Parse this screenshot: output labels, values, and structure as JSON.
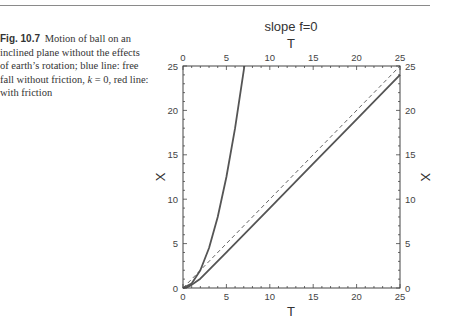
{
  "caption": {
    "fig_label": "Fig. 10.7",
    "text_before_k": "Motion of ball on an inclined plane without the effects of earth’s rotation; blue line: free fall without friction, ",
    "k_symbol": "k",
    "text_after_k": " = 0, red line: with friction"
  },
  "chart_data": {
    "type": "line",
    "title": "slope f=0",
    "xlabel": "T",
    "ylabel": "X",
    "xlabel_top": "T",
    "ylabel_right": "X",
    "xlim": [
      0,
      25
    ],
    "ylim": [
      0,
      25
    ],
    "xticks": [
      0,
      5,
      10,
      15,
      20,
      25
    ],
    "yticks": [
      0,
      5,
      10,
      15,
      20,
      25
    ],
    "minor_tick_step": 1,
    "grid": false,
    "legend": "none",
    "series": [
      {
        "name": "free fall without friction (k=0)",
        "style": "solid",
        "color": "#555555",
        "x": [
          0,
          1,
          2,
          3,
          4,
          5,
          6,
          7,
          7.07
        ],
        "y": [
          0,
          0.5,
          2,
          4.5,
          8,
          12.5,
          18,
          24.5,
          25
        ]
      },
      {
        "name": "with friction",
        "style": "solid",
        "color": "#555555",
        "x": [
          0,
          0.5,
          1,
          1.5,
          2,
          5,
          10,
          15,
          20,
          25
        ],
        "y": [
          0,
          0.1,
          0.35,
          0.7,
          1.05,
          4,
          9,
          14,
          19,
          24
        ]
      },
      {
        "name": "reference X=T",
        "style": "dashed",
        "color": "#555555",
        "x": [
          0,
          25
        ],
        "y": [
          0,
          25
        ]
      }
    ]
  },
  "colors": {
    "line": "#555555",
    "axis": "#444444",
    "rule": "#8a8a8a"
  }
}
